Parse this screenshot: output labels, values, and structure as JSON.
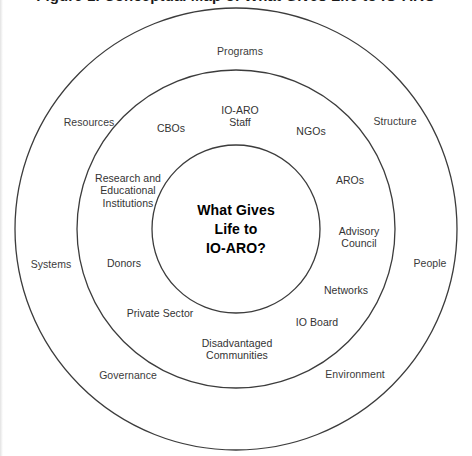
{
  "title": "Figure 1. Conceptual Map of What Gives Life to IO-ARO",
  "diagram": {
    "type": "concentric-circles",
    "center": {
      "x": 236,
      "y": 229
    },
    "rings": [
      {
        "name": "outer-ring",
        "radius": 221
      },
      {
        "name": "middle-ring",
        "radius": 159
      },
      {
        "name": "inner-circle",
        "radius": 84
      }
    ],
    "stroke_color": "#3c3c3c",
    "background_color": "#ffffff",
    "core": {
      "text": "What Gives\nLife to\nIO-ARO?",
      "x": 236,
      "y": 229
    },
    "middle_ring_labels": [
      {
        "name": "cbos",
        "text": "CBOs",
        "x": 171,
        "y": 128
      },
      {
        "name": "io-aro-staff",
        "text": "IO-ARO\nStaff",
        "x": 240,
        "y": 116
      },
      {
        "name": "ngos",
        "text": "NGOs",
        "x": 311,
        "y": 131
      },
      {
        "name": "aros",
        "text": "AROs",
        "x": 350,
        "y": 180
      },
      {
        "name": "advisory-council",
        "text": "Advisory\nCouncil",
        "x": 359,
        "y": 237
      },
      {
        "name": "networks",
        "text": "Networks",
        "x": 346,
        "y": 290
      },
      {
        "name": "io-board",
        "text": "IO Board",
        "x": 317,
        "y": 322
      },
      {
        "name": "disadvantaged-communities",
        "text": "Disadvantaged\nCommunities",
        "x": 237,
        "y": 349
      },
      {
        "name": "private-sector",
        "text": "Private Sector",
        "x": 160,
        "y": 313
      },
      {
        "name": "donors",
        "text": "Donors",
        "x": 124,
        "y": 263
      },
      {
        "name": "research-and-educational-institutions",
        "text": "Research and\nEducational\nInstitutions",
        "x": 128,
        "y": 191
      }
    ],
    "outer_ring_labels": [
      {
        "name": "programs",
        "text": "Programs",
        "x": 240,
        "y": 51
      },
      {
        "name": "structure",
        "text": "Structure",
        "x": 395,
        "y": 121
      },
      {
        "name": "people",
        "text": "People",
        "x": 430,
        "y": 263
      },
      {
        "name": "environment",
        "text": "Environment",
        "x": 355,
        "y": 374
      },
      {
        "name": "governance",
        "text": "Governance",
        "x": 128,
        "y": 375
      },
      {
        "name": "systems",
        "text": "Systems",
        "x": 51,
        "y": 264
      },
      {
        "name": "resources",
        "text": "Resources",
        "x": 89,
        "y": 122
      }
    ]
  }
}
